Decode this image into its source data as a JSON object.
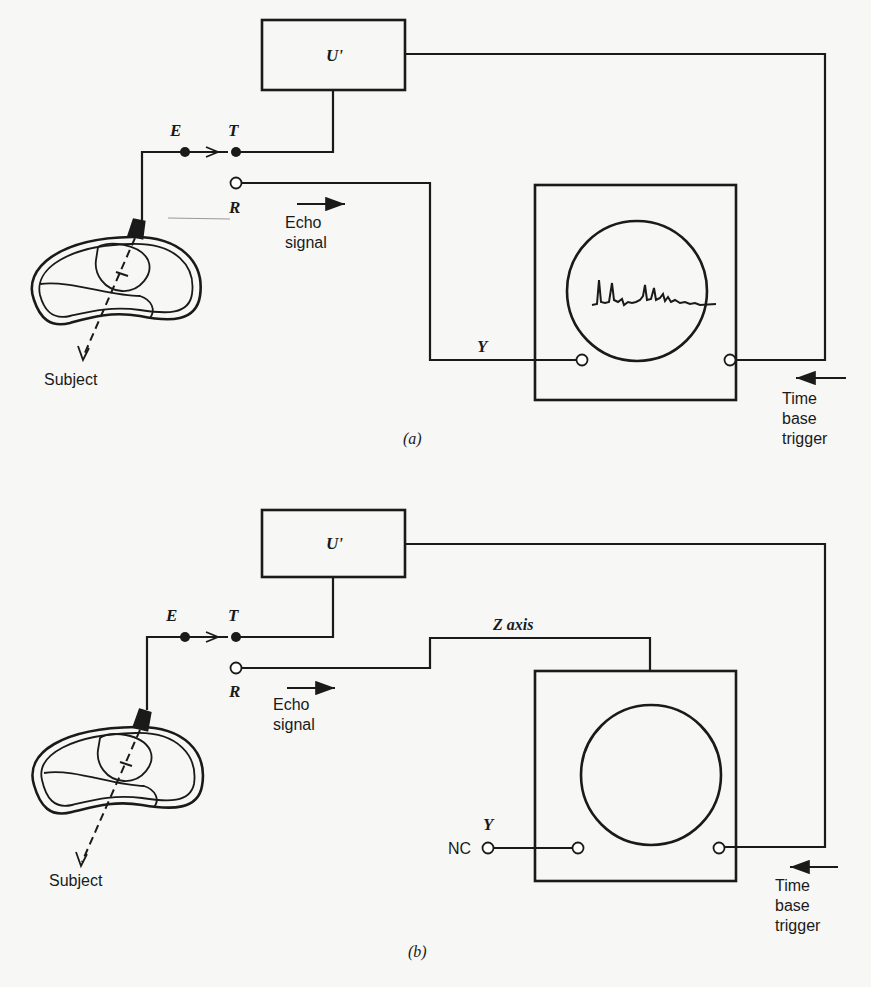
{
  "figure": {
    "panels": [
      {
        "id": "a",
        "caption": "(a)",
        "amplifier_label": "U'",
        "transmitter_label": "T",
        "emitter_label": "E",
        "receiver_label": "R",
        "echo_label_line1": "Echo",
        "echo_label_line2": "signal",
        "y_input_label": "Y",
        "subject_label": "Subject",
        "trigger_label_line1": "Time",
        "trigger_label_line2": "base",
        "trigger_label_line3": "trigger",
        "display_mode": "A-scan trace on screen"
      },
      {
        "id": "b",
        "caption": "(b)",
        "amplifier_label": "U'",
        "transmitter_label": "T",
        "emitter_label": "E",
        "receiver_label": "R",
        "echo_label_line1": "Echo",
        "echo_label_line2": "signal",
        "z_axis_label": "Z  axis",
        "y_input_label": "Y",
        "nc_label": "NC",
        "subject_label": "Subject",
        "trigger_label_line1": "Time",
        "trigger_label_line2": "base",
        "trigger_label_line3": "trigger",
        "display_mode": "blank screen (Z-axis modulation)"
      }
    ]
  }
}
